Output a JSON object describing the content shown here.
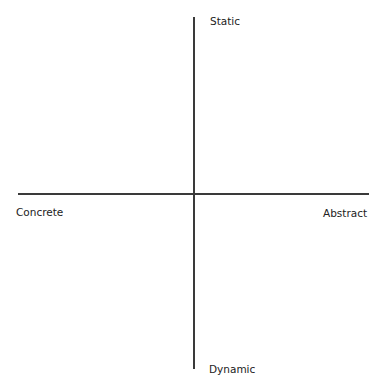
{
  "diagram": {
    "type": "quadrant-axes",
    "axes": {
      "vertical": {
        "top_label": "Static",
        "bottom_label": "Dynamic"
      },
      "horizontal": {
        "left_label": "Concrete",
        "right_label": "Abstract"
      }
    },
    "colors": {
      "background": "#ffffff",
      "line": "#3a3a3a",
      "text": "#222222"
    }
  }
}
